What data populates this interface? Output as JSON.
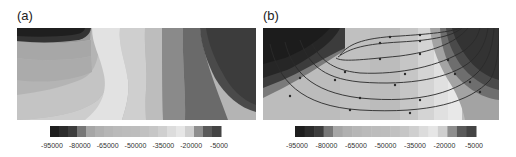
{
  "figure": {
    "panels": [
      {
        "label": "(a)",
        "has_streamlines": false
      },
      {
        "label": "(b)",
        "has_streamlines": true
      }
    ]
  },
  "colorbar": {
    "tick_labels": [
      "-95000",
      "-80000",
      "-65000",
      "-50000",
      "-35000",
      "-20000",
      "-5000"
    ],
    "levels": [
      -95000,
      -90000,
      -85000,
      -80000,
      -75000,
      -70000,
      -65000,
      -60000,
      -55000,
      -50000,
      -45000,
      -40000,
      -35000,
      -30000,
      -25000,
      -20000,
      -15000,
      -10000,
      -5000
    ],
    "colors": [
      "#1e1e1e",
      "#2c2c2c",
      "#3d3d3d",
      "#777777",
      "#a6a6a6",
      "#b0b0b0",
      "#b6b6b6",
      "#bababa",
      "#bcbcbc",
      "#bdbdbd",
      "#c1c1c1",
      "#c6c6c6",
      "#cfcfcf",
      "#dcdcdc",
      "#e6e6e6",
      "#cfcfcf",
      "#8e8e8e",
      "#5a5a5a",
      "#444444"
    ]
  },
  "chart_data": [
    {
      "type": "heatmap",
      "title": "(a)",
      "subtype": "filled contour",
      "xlabel": "",
      "ylabel": "",
      "colorbar_ticks": [
        -95000,
        -80000,
        -65000,
        -50000,
        -35000,
        -20000,
        -5000
      ],
      "colorbar_range": [
        -100000,
        0
      ],
      "description": "Vertical banded field: dark top-left cap, medium grays on left, light band center, darkening toward a dark disc at upper right"
    },
    {
      "type": "heatmap",
      "title": "(b)",
      "subtype": "filled contour with streamlines",
      "xlabel": "",
      "ylabel": "",
      "colorbar_ticks": [
        -95000,
        -80000,
        -65000,
        -50000,
        -35000,
        -20000,
        -5000
      ],
      "colorbar_range": [
        -100000,
        0
      ],
      "streamlines": 7,
      "description": "Dark lobes at top-left and top-right, light U-shaped central region with nested U-shaped streamlines carrying arrow markers"
    }
  ]
}
